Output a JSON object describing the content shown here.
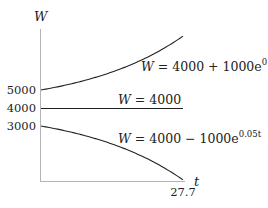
{
  "chart_data": {
    "type": "line",
    "title": "",
    "xlabel": "t",
    "ylabel": "W",
    "xlim": [
      0,
      27.7
    ],
    "ylim": [
      0,
      8200
    ],
    "x_ticks": [
      {
        "value": 27.7,
        "label": "27.7"
      }
    ],
    "y_ticks": [
      {
        "value": 5000,
        "label": "5000"
      },
      {
        "value": 4000,
        "label": "4000"
      },
      {
        "value": 3000,
        "label": "3000"
      }
    ],
    "grid": false,
    "legend": null,
    "series": [
      {
        "name": "W = 4000 + 1000e^{0.05t}",
        "label_main": "W = 4000 + 1000e",
        "label_exp": "0.05t",
        "formula": "4000 + 1000*exp(0.05*t)",
        "x": [
          0,
          5,
          10,
          15,
          20,
          25,
          27.7
        ],
        "values": [
          5000,
          5284,
          5649,
          6117,
          6718,
          7490,
          7995
        ]
      },
      {
        "name": "W = 4000",
        "label_main": "W = 4000",
        "label_exp": "",
        "formula": "4000",
        "x": [
          0,
          27.7
        ],
        "values": [
          4000,
          4000
        ]
      },
      {
        "name": "W = 4000 - 1000e^{0.05t}",
        "label_main": "W = 4000 − 1000e",
        "label_exp": "0.05t",
        "formula": "4000 - 1000*exp(0.05*t)",
        "x": [
          0,
          5,
          10,
          15,
          20,
          25,
          27.7
        ],
        "values": [
          3000,
          2716,
          2351,
          1883,
          1282,
          510,
          5
        ]
      }
    ]
  },
  "axes": {
    "y_label": "W",
    "x_label": "t",
    "x_end_tick": "27.7",
    "y_tick_5000": "5000",
    "y_tick_4000": "4000",
    "y_tick_3000": "3000"
  },
  "labels": {
    "upper_main": "W = 4000 + 1000e",
    "upper_exp": "0.05t",
    "middle": "W = 4000",
    "lower_main": "W = 4000 − 1000e",
    "lower_exp": "0.05t"
  },
  "colors": {
    "axis": "#b0b0b0",
    "curve": "#222222",
    "text": "#222222"
  }
}
